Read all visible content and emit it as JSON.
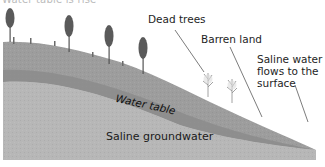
{
  "diagram": {
    "title_partial": "Water table is rise",
    "labels": {
      "dead_trees": "Dead trees",
      "barren_land": "Barren land",
      "saline_flow": "Saline water flows to the surface",
      "water_table": "Water table",
      "saline_groundwater": "Saline groundwater"
    },
    "icons": {
      "living_tree": "pine-tree-icon",
      "dead_tree": "dead-tree-icon"
    },
    "colors": {
      "background": "#ffffff",
      "groundwater": "#b7b7b7",
      "water_table": "#8c8c8c",
      "hill_surface": "#9d9d9d",
      "text": "#1e1e1e",
      "leader_line": "#444444"
    }
  }
}
